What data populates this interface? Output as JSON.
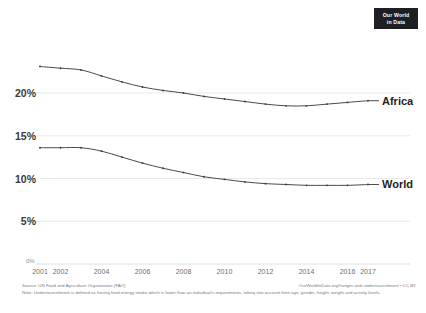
{
  "logo": {
    "line1": "Our World",
    "line2": "in Data"
  },
  "footer": {
    "source": "Source: UN Food and Agriculture Organization (FAO)",
    "attribution": "OurWorldInData.org/hunger-and-undernourishment • CC BY",
    "note": "Note: Undernourishment is defined as having food energy intake which is lower than an individual's requirements, taking into account their age, gender, height, weight and activity levels."
  },
  "chart_data": {
    "type": "line",
    "title": "",
    "xlabel": "",
    "ylabel": "",
    "grid": true,
    "legend_position": "right-inline",
    "xlim": [
      2001,
      2017
    ],
    "ylim": [
      0,
      23.5
    ],
    "x": [
      2001,
      2002,
      2003,
      2004,
      2005,
      2006,
      2007,
      2008,
      2009,
      2010,
      2011,
      2012,
      2013,
      2014,
      2015,
      2016,
      2017
    ],
    "xticks": [
      2001,
      2002,
      2004,
      2006,
      2008,
      2010,
      2012,
      2014,
      2016,
      2017
    ],
    "xticklabels": [
      "2001",
      "2002",
      "2004",
      "2006",
      "2008",
      "2010",
      "2012",
      "2014",
      "2016",
      "2017"
    ],
    "yticks": [
      0,
      5,
      10,
      15,
      20
    ],
    "yticklabels": [
      "0%",
      "5%",
      "10%",
      "15%",
      "20%"
    ],
    "series": [
      {
        "name": "Africa",
        "color": "#4a4a4a",
        "values": [
          23.1,
          22.9,
          22.7,
          22.0,
          21.3,
          20.7,
          20.3,
          20.0,
          19.6,
          19.3,
          19.0,
          18.7,
          18.5,
          18.5,
          18.7,
          18.9,
          19.1
        ]
      },
      {
        "name": "World",
        "color": "#4a4a4a",
        "values": [
          13.6,
          13.6,
          13.6,
          13.2,
          12.5,
          11.8,
          11.2,
          10.7,
          10.2,
          9.9,
          9.6,
          9.4,
          9.3,
          9.2,
          9.2,
          9.2,
          9.3
        ]
      }
    ]
  }
}
